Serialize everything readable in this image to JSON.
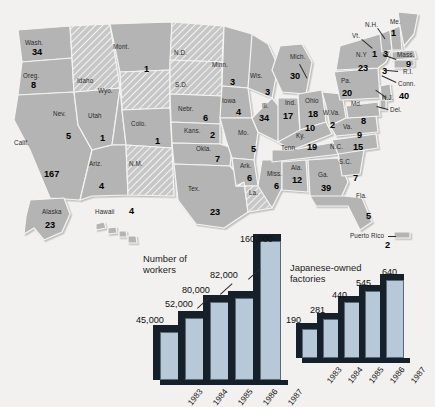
{
  "map": {
    "title": "Japanese investment by state",
    "base_color": "#b4b4b4",
    "hatch_color": "#c9c9c9",
    "border_color": "#f4f4f2",
    "states": [
      {
        "abbr": "Wash.",
        "label": "Wash.",
        "value": "34",
        "lx": 25,
        "ly": 40,
        "vx": 32,
        "vy": 48,
        "hatched": false
      },
      {
        "abbr": "Oreg.",
        "label": "Oreg.",
        "value": "8",
        "lx": 23,
        "ly": 73,
        "vx": 31,
        "vy": 81,
        "hatched": false
      },
      {
        "abbr": "Calif.",
        "label": "Calif.",
        "value": "167",
        "vlabel": "5",
        "lx": 14,
        "ly": 140,
        "vx": 44,
        "vy": 170,
        "hatched": false
      },
      {
        "abbr": "Nev.",
        "label": "Nev.",
        "value": "5",
        "lx": 53,
        "ly": 111,
        "vx": 66,
        "vy": 132,
        "hatched": false
      },
      {
        "abbr": "Idaho",
        "label": "Idaho",
        "value": "",
        "lx": 77,
        "ly": 78,
        "vx": 0,
        "vy": 0,
        "hatched": true
      },
      {
        "abbr": "Mont.",
        "label": "Mont.",
        "value": "1",
        "lx": 113,
        "ly": 44,
        "vx": 144,
        "vy": 65,
        "hatched": false
      },
      {
        "abbr": "Wyo.",
        "label": "Wyo.",
        "value": "",
        "lx": 98,
        "ly": 88,
        "vx": 0,
        "vy": 0,
        "hatched": true
      },
      {
        "abbr": "Utah",
        "label": "Utah",
        "value": "1",
        "lx": 88,
        "ly": 113,
        "vx": 100,
        "vy": 134,
        "hatched": false
      },
      {
        "abbr": "Ariz.",
        "label": "Ariz.",
        "value": "4",
        "lx": 89,
        "ly": 161,
        "vx": 99,
        "vy": 182,
        "hatched": false
      },
      {
        "abbr": "Colo.",
        "label": "Colo.",
        "value": "1",
        "lx": 131,
        "ly": 121,
        "vx": 155,
        "vy": 137,
        "hatched": false
      },
      {
        "abbr": "N.M.",
        "label": "N.M.",
        "value": "",
        "lx": 129,
        "ly": 161,
        "vx": 0,
        "vy": 0,
        "hatched": true
      },
      {
        "abbr": "N.D.",
        "label": "N.D.",
        "value": "",
        "lx": 174,
        "ly": 50,
        "vx": 0,
        "vy": 0,
        "hatched": true
      },
      {
        "abbr": "S.D.",
        "label": "S.D.",
        "value": "",
        "lx": 175,
        "ly": 82,
        "vx": 0,
        "vy": 0,
        "hatched": true
      },
      {
        "abbr": "Nebr.",
        "label": "Nebr.",
        "value": "6",
        "lx": 178,
        "ly": 106,
        "vx": 203,
        "vy": 114,
        "hatched": false
      },
      {
        "abbr": "Kans.",
        "label": "Kans.",
        "value": "2",
        "lx": 184,
        "ly": 128,
        "vx": 210,
        "vy": 131,
        "hatched": false
      },
      {
        "abbr": "Okla.",
        "label": "Okla.",
        "value": "7",
        "lx": 196,
        "ly": 146,
        "vx": 215,
        "vy": 155,
        "hatched": false
      },
      {
        "abbr": "Tex.",
        "label": "Tex.",
        "value": "23",
        "lx": 188,
        "ly": 186,
        "vx": 210,
        "vy": 208,
        "hatched": false
      },
      {
        "abbr": "Minn.",
        "label": "Minn.",
        "value": "3",
        "lx": 212,
        "ly": 62,
        "vx": 230,
        "vy": 78,
        "hatched": false
      },
      {
        "abbr": "Iowa",
        "label": "Iowa",
        "value": "4",
        "lx": 222,
        "ly": 98,
        "vx": 236,
        "vy": 108,
        "hatched": false
      },
      {
        "abbr": "Mo.",
        "label": "Mo.",
        "value": "5",
        "lx": 238,
        "ly": 130,
        "vx": 251,
        "vy": 145,
        "hatched": false
      },
      {
        "abbr": "Ark.",
        "label": "Ark.",
        "value": "6",
        "lx": 240,
        "ly": 163,
        "vx": 247,
        "vy": 174,
        "hatched": false
      },
      {
        "abbr": "La.",
        "label": "La.",
        "value": "",
        "lx": 249,
        "ly": 190,
        "vx": 0,
        "vy": 0,
        "hatched": true
      },
      {
        "abbr": "Wis.",
        "label": "Wis.",
        "value": "3",
        "lx": 250,
        "ly": 73,
        "vx": 265,
        "vy": 88,
        "hatched": false
      },
      {
        "abbr": "Ill.",
        "label": "Ill.",
        "value": "34",
        "lx": 262,
        "ly": 103,
        "vx": 259,
        "vy": 114,
        "hatched": false
      },
      {
        "abbr": "Miss.",
        "label": "Miss.",
        "value": "6",
        "lx": 267,
        "ly": 171,
        "vx": 274,
        "vy": 182,
        "hatched": false
      },
      {
        "abbr": "Ind.",
        "label": "Ind.",
        "value": "17",
        "lx": 285,
        "ly": 100,
        "vx": 283,
        "vy": 112,
        "hatched": false
      },
      {
        "abbr": "Mich.",
        "label": "Mich.",
        "value": "30",
        "lx": 290,
        "ly": 54,
        "vx": 290,
        "vy": 72,
        "hatched": false
      },
      {
        "abbr": "Ohio",
        "label": "Ohio",
        "value": "18",
        "lx": 305,
        "ly": 98,
        "vx": 308,
        "vy": 110,
        "hatched": false
      },
      {
        "abbr": "Ky.",
        "label": "Ky.",
        "value": "10",
        "lx": 296,
        "ly": 133,
        "vx": 305,
        "vy": 124,
        "hatched": false
      },
      {
        "abbr": "Tenn.",
        "label": "Tenn.",
        "value": "19",
        "lx": 281,
        "ly": 145,
        "vx": 307,
        "vy": 143,
        "hatched": false
      },
      {
        "abbr": "Ala.",
        "label": "Ala.",
        "value": "12",
        "lx": 291,
        "ly": 165,
        "vx": 292,
        "vy": 176,
        "hatched": false
      },
      {
        "abbr": "Ga.",
        "label": "Ga.",
        "value": "39",
        "lx": 318,
        "ly": 172,
        "vx": 321,
        "vy": 184,
        "hatched": false
      },
      {
        "abbr": "Fla.",
        "label": "Fla.",
        "value": "5",
        "lx": 356,
        "ly": 193,
        "vx": 366,
        "vy": 212,
        "hatched": false
      },
      {
        "abbr": "S.C.",
        "label": "S.C.",
        "value": "7",
        "lx": 339,
        "ly": 159,
        "vx": 353,
        "vy": 174,
        "hatched": false
      },
      {
        "abbr": "N.C.",
        "label": "N.C.",
        "value": "15",
        "lx": 330,
        "ly": 144,
        "vx": 353,
        "vy": 143,
        "hatched": false
      },
      {
        "abbr": "W.Va.",
        "label": "W.Va.",
        "value": "2",
        "lx": 323,
        "ly": 110,
        "vx": 330,
        "vy": 121,
        "hatched": false
      },
      {
        "abbr": "Va.",
        "label": "Va.",
        "value": "9",
        "lx": 343,
        "ly": 124,
        "vx": 357,
        "vy": 131,
        "hatched": false
      },
      {
        "abbr": "Md.",
        "label": "Md.",
        "value": "8",
        "lx": 351,
        "ly": 101,
        "vx": 361,
        "vy": 117,
        "hatched": false
      },
      {
        "abbr": "Pa.",
        "label": "Pa.",
        "value": "20",
        "lx": 341,
        "ly": 78,
        "vx": 342,
        "vy": 89,
        "hatched": false
      },
      {
        "abbr": "N.Y",
        "label": "N.Y",
        "value": "23",
        "lx": 356,
        "ly": 52,
        "vx": 358,
        "vy": 64,
        "hatched": false
      },
      {
        "abbr": "Vt.",
        "label": "Vt.",
        "value": "1",
        "lx": 352,
        "ly": 33,
        "vx": 372,
        "vy": 50,
        "hatched": false
      },
      {
        "abbr": "N.H.",
        "label": "N.H.",
        "value": "3",
        "lx": 365,
        "ly": 22,
        "vx": 383,
        "vy": 50,
        "hatched": false
      },
      {
        "abbr": "Me.",
        "label": "Me.",
        "value": "1",
        "lx": 390,
        "ly": 19,
        "vx": 391,
        "vy": 29,
        "hatched": false
      },
      {
        "abbr": "Mass.",
        "label": "Mass.",
        "value": "9",
        "lx": 397,
        "ly": 52,
        "vx": 406,
        "vy": 60,
        "hatched": false
      },
      {
        "abbr": "R.I.",
        "label": "R.I.",
        "value": "3",
        "lx": 403,
        "ly": 69,
        "vx": 382,
        "vy": 67,
        "hatched": false
      },
      {
        "abbr": "Conn.",
        "label": "Conn.",
        "value": "",
        "lx": 398,
        "ly": 81,
        "vx": 0,
        "vy": 0,
        "hatched": false
      },
      {
        "abbr": "N.J.",
        "label": "N.J.",
        "value": "40",
        "lx": 382,
        "ly": 95,
        "vx": 399,
        "vy": 92,
        "hatched": false
      },
      {
        "abbr": "Del.",
        "label": "Del.",
        "value": "",
        "lx": 390,
        "ly": 107,
        "vx": 0,
        "vy": 0,
        "hatched": false
      },
      {
        "abbr": "Alaska",
        "label": "Alaska",
        "value": "23",
        "lx": 42,
        "ly": 209,
        "vx": 45,
        "vy": 221,
        "hatched": false
      },
      {
        "abbr": "Hawaii",
        "label": "Hawaii",
        "value": "4",
        "lx": 95,
        "ly": 209,
        "vx": 129,
        "vy": 207,
        "hatched": false
      },
      {
        "abbr": "PuertoRico",
        "label": "Puerto Rico",
        "value": "2",
        "lx": 350,
        "ly": 233,
        "vx": 385,
        "vy": 241,
        "hatched": false
      }
    ]
  },
  "chart_data": [
    {
      "type": "bar",
      "name": "workers",
      "title": "Number of\nworkers",
      "categories": [
        "1983",
        "1984",
        "1985",
        "1986",
        "1987"
      ],
      "values": [
        45000,
        80000,
        52000,
        82000,
        160000
      ],
      "value_labels": [
        "45,000",
        "52,000",
        "80,000",
        "82,000",
        "160,000"
      ],
      "bar_heights": [
        48,
        62,
        78,
        82,
        139
      ],
      "ylim": [
        0,
        160000
      ],
      "xlabel": "",
      "ylabel": "",
      "grid": false,
      "legend": "none"
    },
    {
      "type": "bar",
      "name": "factories",
      "title": "Japanese-owned\nfactories",
      "categories": [
        "1983",
        "1984",
        "1985",
        "1986",
        "1987"
      ],
      "values": [
        190,
        281,
        440,
        545,
        640
      ],
      "value_labels": [
        "190",
        "281",
        "440",
        "545",
        "640"
      ],
      "bar_heights": [
        29,
        39,
        56,
        67,
        78
      ],
      "ylim": [
        0,
        640
      ],
      "xlabel": "",
      "ylabel": "",
      "grid": false,
      "legend": "none"
    }
  ],
  "colors": {
    "bar_face": "#b7c8d8",
    "bar_dark": "#16202b",
    "map_fill": "#b4b4b4",
    "page_bg": "#f2f1ef"
  }
}
